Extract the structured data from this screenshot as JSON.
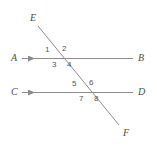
{
  "figure": {
    "background_color": "#ffffff",
    "line_color": "#8c8c8c",
    "label_color": "#4d4d4d",
    "number_color": "#555555",
    "width": 157,
    "height": 148
  },
  "lines": [
    {
      "name": "line-ab",
      "start_label": "A",
      "end_label": "B",
      "x1": 28,
      "y1": 58,
      "x2": 133,
      "y2": 58,
      "has_arrow": true,
      "arrow_direction": "right"
    },
    {
      "name": "line-cd",
      "start_label": "C",
      "end_label": "D",
      "x1": 28,
      "y1": 92,
      "x2": 133,
      "y2": 92,
      "has_arrow": true,
      "arrow_direction": "right"
    },
    {
      "name": "line-ef",
      "start_label": "E",
      "end_label": "F",
      "x1": 38,
      "y1": 26,
      "x2": 119,
      "y2": 125,
      "has_arrow": false,
      "arrow_direction": ""
    }
  ],
  "endpoint_labels": {
    "E": "E",
    "A": "A",
    "B": "B",
    "C": "C",
    "D": "D",
    "F": "F"
  },
  "angle_numbers": {
    "n1": "1",
    "n2": "2",
    "n3": "3",
    "n4": "4",
    "n5": "5",
    "n6": "6",
    "n7": "7",
    "n8": "8"
  },
  "intersections": [
    {
      "name": "upper-intersection",
      "x": 57,
      "y": 58
    },
    {
      "name": "lower-intersection",
      "x": 84,
      "y": 92
    }
  ]
}
